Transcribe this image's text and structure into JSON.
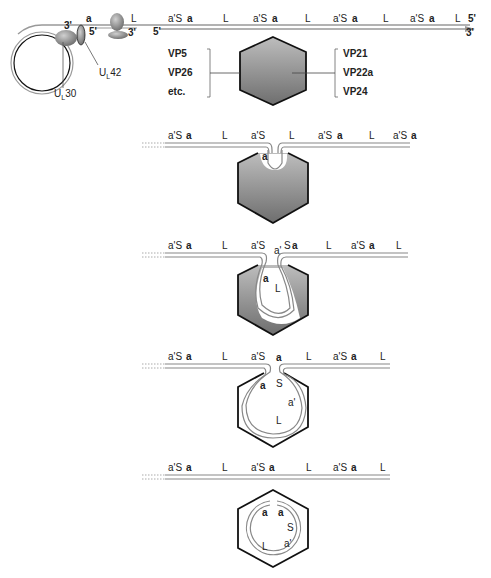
{
  "panel1": {
    "strand_labels": [
      {
        "text": "a",
        "bold": true
      },
      {
        "text": "L"
      },
      {
        "text": "a'S"
      },
      {
        "text": "a",
        "bold": true
      },
      {
        "text": "L"
      },
      {
        "text": "a'S"
      },
      {
        "text": "a",
        "bold": true
      },
      {
        "text": "L"
      },
      {
        "text": "a'S"
      },
      {
        "text": "a",
        "bold": true
      },
      {
        "text": "L"
      },
      {
        "text": "a'S"
      },
      {
        "text": "a",
        "bold": true
      },
      {
        "text": "L"
      }
    ],
    "ends": {
      "top_right": "5'",
      "bottom_right": "3'",
      "left_three_prime": "3'",
      "left_five_prime": "5'",
      "terminase_three_prime": "3'",
      "lower_five_prime": "5'"
    },
    "proteins": {
      "ul42": "U",
      "ul42_sub": "L",
      "ul42_num": "42",
      "ul30": "U",
      "ul30_sub": "L",
      "ul30_num": "30"
    },
    "left_group": [
      "VP5",
      "VP26",
      "etc."
    ],
    "right_group": [
      "VP21",
      "VP22a",
      "VP24"
    ]
  },
  "panel2": {
    "labels": [
      "a'S",
      "a",
      "L",
      "a'S",
      "L",
      "a'S",
      "a",
      "L",
      "a'S",
      "a"
    ],
    "inner": "a"
  },
  "panel3": {
    "labels": [
      "a'S",
      "a",
      "L",
      "a'S",
      "a'",
      "S",
      "a",
      "L",
      "a'S",
      "a",
      "L"
    ],
    "inner": [
      "a",
      "L"
    ]
  },
  "panel4": {
    "labels": [
      "a'S",
      "a",
      "L",
      "a'S",
      "a",
      "L",
      "a'S",
      "a",
      "L"
    ],
    "inner": [
      "a",
      "S",
      "a'",
      "L"
    ]
  },
  "panel5": {
    "labels": [
      "a'S",
      "a",
      "L",
      "a'S",
      "a",
      "L",
      "a'S",
      "a",
      "L"
    ],
    "inner": [
      "a",
      "a",
      "S",
      "a'",
      "L"
    ]
  },
  "colors": {
    "capsid_fill_light": "#c8c8c8",
    "capsid_fill_dark": "#7a7a7a",
    "capsid_stroke": "#111111",
    "dna_line": "#888888",
    "text": "#222222"
  }
}
